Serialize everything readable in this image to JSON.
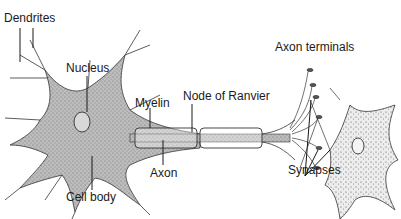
{
  "diagram": {
    "labels": {
      "dendrites": "Dendrites",
      "nucleus": "Nucleus",
      "cell_body": "Cell body",
      "myelin": "Myelin",
      "axon": "Axon",
      "node_of_ranvier": "Node of Ranvier",
      "axon_terminals": "Axon terminals",
      "synapses": "Synapses"
    },
    "colors": {
      "ink": "#1a1a1a",
      "cell_fill": "#b8b8b8",
      "cell_fill_light": "#e6e6e6",
      "background": "#ffffff"
    }
  }
}
